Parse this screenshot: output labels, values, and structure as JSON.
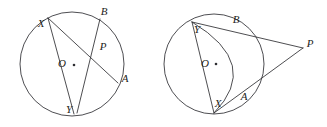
{
  "figure": {
    "background_color": "#ffffff",
    "stroke_color": "#2e2e32",
    "label_color": "#1d1d20",
    "panels": [
      {
        "name": "left-panel",
        "description": "Circle with center O and two intersecting chords XA and BY meeting at interior point P",
        "circle": {
          "cx": 72,
          "cy": 64,
          "r": 52
        },
        "center": {
          "label": "O",
          "dot_x": 74,
          "dot_y": 65,
          "label_x": 62,
          "label_y": 64
        },
        "points": [
          {
            "label": "X",
            "x": 48,
            "y": 18,
            "label_x": 41,
            "label_y": 24
          },
          {
            "label": "B",
            "x": 100,
            "y": 19,
            "label_x": 103,
            "label_y": 12
          },
          {
            "label": "P",
            "x": 95,
            "y": 48,
            "label_x": 102,
            "label_y": 47
          },
          {
            "label": "A",
            "x": 118,
            "y": 83,
            "label_x": 124,
            "label_y": 79
          },
          {
            "label": "Y",
            "x": 77,
            "y": 113,
            "label_x": 69,
            "label_y": 110
          }
        ],
        "segments": [
          {
            "name": "chord-X-A",
            "from": "X",
            "to": "A"
          },
          {
            "name": "chord-B-Y",
            "from": "B",
            "to": "Y"
          },
          {
            "name": "chord-X-Y",
            "from": "X",
            "to": "Y"
          }
        ]
      },
      {
        "name": "right-panel",
        "description": "Circle with center O, diameter Y to X, and external point P with secants through B and A",
        "circle": {
          "cx": 214,
          "cy": 64,
          "r": 50
        },
        "center": {
          "label": "O",
          "dot_x": 216,
          "dot_y": 64,
          "label_x": 205,
          "label_y": 64
        },
        "points": [
          {
            "label": "Y",
            "x": 192,
            "y": 22,
            "label_x": 197,
            "label_y": 29
          },
          {
            "label": "B",
            "x": 233,
            "y": 27,
            "label_x": 236,
            "label_y": 20
          },
          {
            "label": "P",
            "x": 303,
            "y": 48,
            "label_x": 309,
            "label_y": 44
          },
          {
            "label": "A",
            "x": 236,
            "y": 101,
            "label_x": 243,
            "label_y": 97
          },
          {
            "label": "X",
            "x": 214,
            "y": 112,
            "label_x": 218,
            "label_y": 104
          }
        ],
        "segments": [
          {
            "name": "diameter-Y-X",
            "from": "Y",
            "to": "X"
          },
          {
            "name": "secant-Y-B-P",
            "from": "Y",
            "to": "P"
          },
          {
            "name": "secant-X-A-P",
            "from": "X",
            "to": "P"
          }
        ],
        "extra_arc": {
          "name": "inner-arc-B-A",
          "description": "Arc through B and A bulging to the right inside the circle"
        }
      }
    ]
  }
}
